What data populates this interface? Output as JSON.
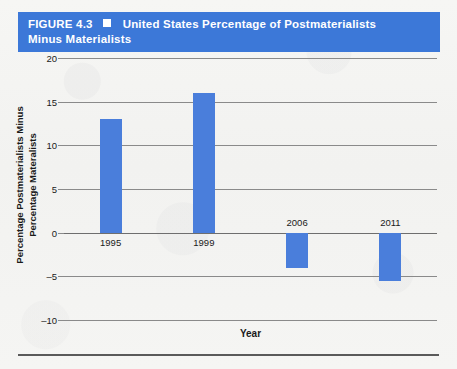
{
  "banner": {
    "figure_number": "FIGURE 4.3",
    "bullet": "square-bullet",
    "title_line1": "United States Percentage of Postmaterialists",
    "title_line2": "Minus Materialists",
    "background_color": "#3c78d8",
    "text_color": "#ffffff"
  },
  "chart_data": {
    "type": "bar",
    "title": "United States Percentage of Postmaterialists Minus Materialists",
    "categories": [
      "1995",
      "1999",
      "2006",
      "2011"
    ],
    "values": [
      13,
      16,
      -4,
      -5.5
    ],
    "xlabel": "Year",
    "ylabel": "Percentage Postmaterialists Minus Percentage Materalists",
    "ylabel_line1": "Percentage Postmaterialists Minus",
    "ylabel_line2": "Percentage Materalists",
    "ylim": [
      -10,
      20
    ],
    "ytick_values": [
      20,
      15,
      10,
      5,
      0,
      -5,
      -10
    ],
    "ytick_labels": [
      "20",
      "15",
      "10",
      "5",
      "0",
      "–5",
      "–10"
    ],
    "grid": true,
    "legend": "none",
    "bar_color": "#4a7edb",
    "series": [
      {
        "name": "Postmaterialists minus Materialists",
        "values": [
          13,
          16,
          -4,
          -5.5
        ]
      }
    ]
  }
}
